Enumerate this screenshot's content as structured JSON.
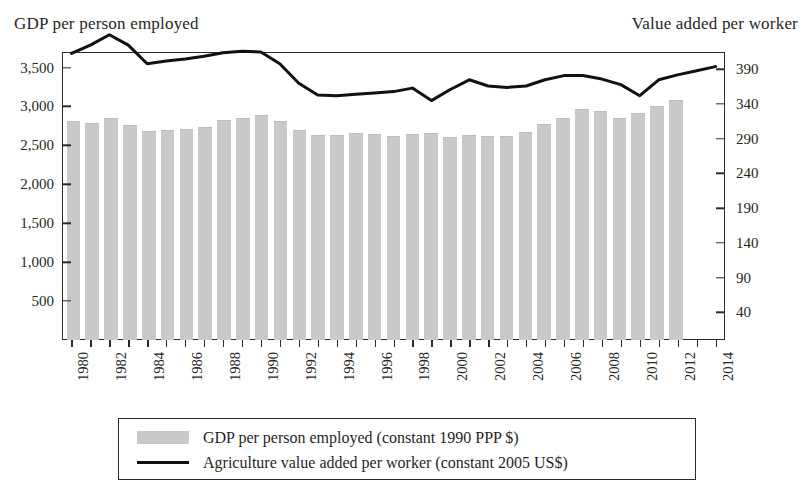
{
  "titles": {
    "left_axis": "GDP per person employed",
    "right_axis": "Value added per worker"
  },
  "legend": {
    "items": [
      {
        "label": "GDP per person employed (constant 1990 PPP $)",
        "marker": "bar-swatch",
        "color": "#c9c9c9"
      },
      {
        "label": "Agriculture value added per worker (constant 2005 US$)",
        "marker": "line-swatch",
        "color": "#111111"
      }
    ]
  },
  "chart_data": {
    "type": "bar",
    "title": "",
    "xlabel": "",
    "grid": false,
    "legend_position": "bottom",
    "categories": [
      "1980",
      "1981",
      "1982",
      "1983",
      "1984",
      "1985",
      "1986",
      "1987",
      "1988",
      "1989",
      "1990",
      "1991",
      "1992",
      "1993",
      "1994",
      "1995",
      "1996",
      "1997",
      "1998",
      "1999",
      "2000",
      "2001",
      "2002",
      "2003",
      "2004",
      "2005",
      "2006",
      "2007",
      "2008",
      "2009",
      "2010",
      "2011",
      "2012",
      "2013",
      "2014"
    ],
    "x_tick_labels": [
      "1980",
      "1982",
      "1984",
      "1986",
      "1988",
      "1990",
      "1992",
      "1994",
      "1996",
      "1998",
      "2000",
      "2002",
      "2004",
      "2006",
      "2008",
      "2010",
      "2012",
      "2014"
    ],
    "left_axis": {
      "label": "GDP per person employed",
      "ylim": [
        0,
        3700
      ],
      "ticks": [
        500,
        1000,
        1500,
        2000,
        2500,
        3000,
        3500
      ],
      "tick_labels": [
        "500",
        "1,000",
        "1,500",
        "2,000",
        "2,500",
        "3,000",
        "3,500"
      ]
    },
    "right_axis": {
      "label": "Value added per worker",
      "ylim": [
        0,
        415
      ],
      "ticks": [
        40,
        90,
        140,
        190,
        240,
        290,
        340,
        390
      ],
      "tick_labels": [
        "40",
        "90",
        "140",
        "190",
        "240",
        "290",
        "340",
        "390"
      ]
    },
    "series": [
      {
        "name": "GDP per person employed (constant 1990 PPP $)",
        "type": "bar",
        "axis": "left",
        "color": "#c9c9c9",
        "values": [
          2800,
          2775,
          2840,
          2745,
          2675,
          2685,
          2700,
          2730,
          2810,
          2840,
          2880,
          2800,
          2690,
          2620,
          2625,
          2650,
          2640,
          2610,
          2630,
          2650,
          2600,
          2620,
          2605,
          2610,
          2665,
          2760,
          2840,
          2950,
          2930,
          2845,
          2900,
          2990,
          3065,
          null,
          null
        ]
      },
      {
        "name": "Agriculture value added per worker (constant 2005 US$)",
        "type": "line",
        "axis": "right",
        "color": "#111111",
        "values": [
          413,
          425,
          440,
          425,
          398,
          402,
          405,
          409,
          414,
          416,
          415,
          398,
          370,
          353,
          352,
          354,
          356,
          358,
          363,
          345,
          361,
          375,
          366,
          364,
          366,
          375,
          381,
          381,
          376,
          368,
          352,
          375,
          382,
          388,
          394
        ]
      }
    ]
  }
}
